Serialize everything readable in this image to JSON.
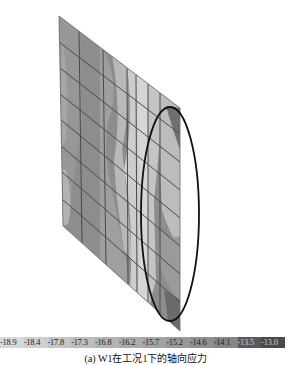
{
  "figure": {
    "caption": "(a) W1在工况1下的轴向应力",
    "plate": {
      "corners": {
        "top_left": [
          59,
          16
        ],
        "bottom_left": [
          63,
          226
        ],
        "top_right": [
          180,
          108
        ],
        "bottom_right": [
          180,
          331
        ]
      },
      "grid_x": [
        79,
        103,
        127,
        136,
        148,
        160
      ],
      "grid_rows": 8,
      "base_fill": "#8a8a8a"
    },
    "highlight_ellipse": {
      "cx": 170,
      "cy": 214,
      "rx": 29,
      "ry": 107,
      "stroke": "#111111"
    }
  },
  "colorbar": {
    "labels": [
      "-18.9",
      "-18.4",
      "-17.8",
      "-17.3",
      "-16.8",
      "-16.2",
      "-15.7",
      "-15.2",
      "-14.6",
      "-14.1",
      "-13.5",
      "-13.0"
    ],
    "colors": [
      "#d8d8d8",
      "#cfcfcf",
      "#c6c6c6",
      "#bdbdbd",
      "#b4b4b4",
      "#ababab",
      "#a2a2a2",
      "#999999",
      "#8f8f8f",
      "#858585",
      "#5a5a5a",
      "#4a4a4a"
    ]
  }
}
